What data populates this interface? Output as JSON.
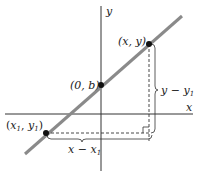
{
  "diagram": {
    "type": "coordinate-geometry",
    "title": "",
    "axes": {
      "x_label": "x",
      "y_label": "y"
    },
    "line": {
      "color": "#8a8a8a",
      "description": "straight line with positive slope"
    },
    "points": [
      {
        "id": "p1",
        "label_open": "(",
        "label_var1": "x",
        "label_sub1": "1",
        "label_comma": ", ",
        "label_var2": "y",
        "label_sub2": "1",
        "label_close": ")"
      },
      {
        "id": "intercept",
        "label": "(0, b)"
      },
      {
        "id": "p",
        "label": "(x, y)"
      }
    ],
    "measurements": {
      "horizontal": {
        "var": "x",
        "minus": " − ",
        "sub_var": "x",
        "sub": "1"
      },
      "vertical": {
        "var": "y",
        "minus": " − ",
        "sub_var": "y",
        "sub": "1"
      }
    },
    "colors": {
      "axis": "#333333",
      "line": "#8a8a8a",
      "point": "#111111",
      "dashed": "#333333"
    }
  }
}
